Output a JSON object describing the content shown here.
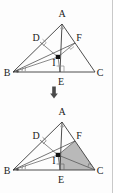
{
  "figure": {
    "type": "geometry-diagram",
    "colors": {
      "stroke": "#3a3a3a",
      "label": "#1b1b1b",
      "shade_fill": "#b9b9b9",
      "point_fill": "#111111",
      "border": "#c9c9c9",
      "background": "#fdfdfd"
    },
    "vertices": {
      "A": {
        "label": "A",
        "x": 62,
        "y": 24
      },
      "B": {
        "label": "B",
        "x": 13,
        "y": 72
      },
      "C": {
        "label": "C",
        "x": 95,
        "y": 72
      },
      "D": {
        "label": "D",
        "x": 40,
        "y": 42
      },
      "E": {
        "label": "E",
        "x": 60,
        "y": 72
      },
      "F": {
        "label": "F",
        "x": 75,
        "y": 43
      },
      "I": {
        "label": "I",
        "x": 58,
        "y": 57
      }
    },
    "segments": [
      "AB",
      "BC",
      "CA",
      "AE",
      "BF",
      "BI",
      "ID",
      "IE",
      "IF",
      "CI"
    ],
    "right_angle_marks": [
      "D",
      "E",
      "F",
      "C-in-shaded"
    ],
    "angle_marks_at_B": 2,
    "point_marker": "filled-square-at-I",
    "shaded_region": {
      "present_in": "bottom",
      "vertices": [
        "I",
        "F",
        "C",
        "E"
      ],
      "fill": "#b9b9b9"
    }
  },
  "transform_arrow": {
    "name": "down-arrow",
    "glyph": "⬇",
    "direction": "down"
  },
  "labels": {
    "A": "A",
    "B": "B",
    "C": "C",
    "D": "D",
    "E": "E",
    "F": "F",
    "I": "I"
  }
}
